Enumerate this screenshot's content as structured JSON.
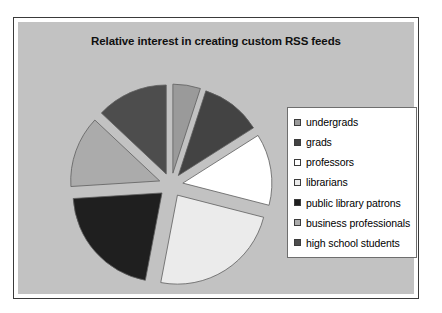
{
  "chart_data": {
    "type": "pie",
    "title": "Relative interest in creating custom RSS feeds",
    "categories": [
      "undergrads",
      "grads",
      "professors",
      "librarians",
      "public library patrons",
      "business professionals",
      "high school students"
    ],
    "values": [
      5,
      11,
      13,
      24,
      21,
      13,
      13
    ],
    "colors": [
      "#9a9a9a",
      "#434343",
      "#ffffff",
      "#ebebeb",
      "#1f1f1f",
      "#ababab",
      "#4d4d4d"
    ],
    "legend_position": "right",
    "exploded": true,
    "start_angle_deg": 0,
    "direction": "clockwise",
    "plot_background_color": "#c2c2c2",
    "slice_outline_color": "#5e5e5e"
  }
}
